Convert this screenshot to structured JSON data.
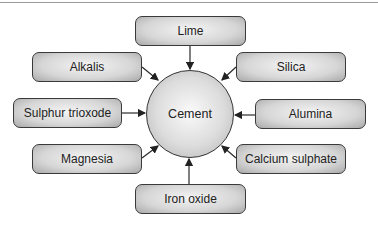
{
  "diagram": {
    "type": "hub-and-spoke",
    "center": {
      "label": "Cement"
    },
    "inputs": [
      {
        "id": "lime",
        "label": "Lime"
      },
      {
        "id": "alkalis",
        "label": "Alkalis"
      },
      {
        "id": "silica",
        "label": "Silica"
      },
      {
        "id": "sulphur-trioxode",
        "label": "Sulphur trioxode"
      },
      {
        "id": "alumina",
        "label": "Alumina"
      },
      {
        "id": "magnesia",
        "label": "Magnesia"
      },
      {
        "id": "calcium-sulphate",
        "label": "Calcium sulphate"
      },
      {
        "id": "iron-oxide",
        "label": "Iron oxide"
      }
    ],
    "edges_direction": "inputs-to-center",
    "colors": {
      "stroke": "#333333",
      "fill_light": "#f4f4f4",
      "fill_dark": "#a9a9a9"
    }
  }
}
